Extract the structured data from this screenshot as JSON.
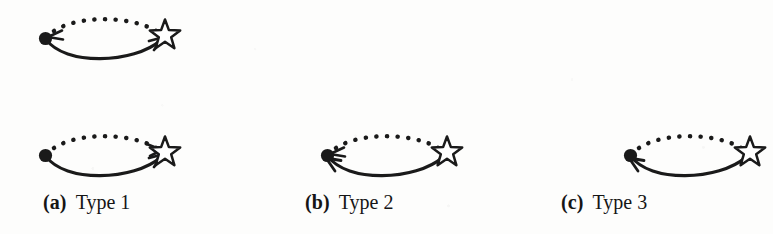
{
  "figure": {
    "kind": "mathematical-diagram",
    "ink_color": "#1a1a1a",
    "paper_color": "#fdfdfc",
    "node_left": "filled-dot",
    "node_right": "five-pointed-star-outline",
    "upper_arc_style": "dotted",
    "lower_arc_style": "solid"
  },
  "panels": [
    {
      "id": "top",
      "tag": "",
      "title": "",
      "caption_visible": false,
      "dotted_arrow": "to-dot",
      "solid_arrow": "to-star"
    },
    {
      "id": "a",
      "tag": "(a)",
      "title": "Type 1",
      "caption_visible": true,
      "dotted_arrow": "to-star",
      "solid_arrow": "to-star"
    },
    {
      "id": "b",
      "tag": "(b)",
      "title": "Type 2",
      "caption_visible": true,
      "dotted_arrow": "to-dot",
      "solid_arrow": "to-dot"
    },
    {
      "id": "c",
      "tag": "(c)",
      "title": "Type 3",
      "caption_visible": true,
      "dotted_arrow": "none",
      "solid_arrow": "to-dot"
    }
  ]
}
